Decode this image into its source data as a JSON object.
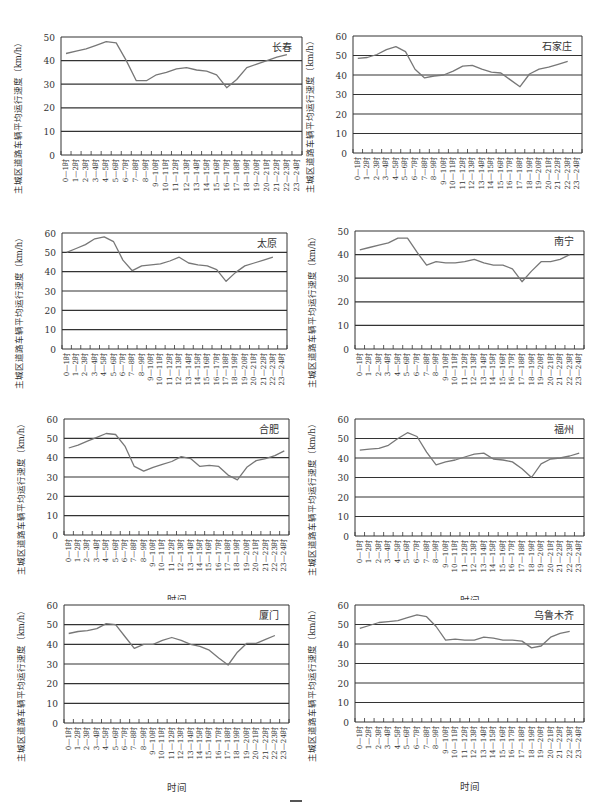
{
  "common": {
    "ylabel": "主城区道路车辆平均运行速度（km/h）",
    "xlabel": "时间",
    "categories": [
      "0—1时",
      "1—2时",
      "2—3时",
      "3—4时",
      "4—5时",
      "5—6时",
      "6—7时",
      "7—8时",
      "8—9时",
      "9—10时",
      "10—11时",
      "11—12时",
      "12—13时",
      "13—14时",
      "14—15时",
      "15—16时",
      "16—17时",
      "17—18时",
      "18—19时",
      "19—20时",
      "20—21时",
      "21—22时",
      "22—23时",
      "23—24时"
    ]
  },
  "chart_data": [
    {
      "type": "line",
      "title": "长春",
      "xlabel": "时间",
      "ylabel": "主城区道路车辆平均运行速度（km/h）",
      "ylim": [
        0,
        50
      ],
      "yticks": [
        0,
        10,
        20,
        30,
        40,
        50
      ],
      "grid": true,
      "categories": [
        "0—1时",
        "1—2时",
        "2—3时",
        "3—4时",
        "4—5时",
        "5—6时",
        "6—7时",
        "7—8时",
        "8—9时",
        "9—10时",
        "10—11时",
        "11—12时",
        "12—13时",
        "13—14时",
        "14—15时",
        "15—16时",
        "16—17时",
        "17—18时",
        "18—19时",
        "19—20时",
        "20—21时",
        "21—22时",
        "22—23时",
        "23—24时"
      ],
      "values": [
        43,
        44,
        45,
        46.5,
        48,
        47.5,
        40,
        31.5,
        31.5,
        34,
        35,
        36.5,
        37,
        36,
        35.5,
        34,
        28.5,
        32,
        37,
        38.5,
        40,
        41.5,
        42.5,
        null
      ]
    },
    {
      "type": "line",
      "title": "石家庄",
      "xlabel": "时间",
      "ylabel": "主城区道路车辆平均运行速度（km/h）",
      "ylim": [
        0,
        60
      ],
      "yticks": [
        0,
        10,
        20,
        30,
        40,
        50,
        60
      ],
      "grid": true,
      "categories": [
        "0—1时",
        "1—2时",
        "2—3时",
        "3—4时",
        "4—5时",
        "5—6时",
        "6—7时",
        "7—8时",
        "8—9时",
        "9—10时",
        "10—11时",
        "11—12时",
        "12—13时",
        "13—14时",
        "14—15时",
        "15—16时",
        "16—17时",
        "17—18时",
        "18—19时",
        "19—20时",
        "20—21时",
        "21—22时",
        "22—23时",
        "23—24时"
      ],
      "values": [
        48.5,
        49,
        50.5,
        53,
        54.5,
        52,
        43,
        38.5,
        39.5,
        40,
        42,
        44.5,
        45,
        43,
        41.5,
        41,
        37.5,
        34,
        40.5,
        43,
        44,
        45.5,
        47,
        null
      ]
    },
    {
      "type": "line",
      "title": "太原",
      "xlabel": "时间",
      "ylabel": "主城区道路车辆平均运行速度（km/h）",
      "ylim": [
        0,
        60
      ],
      "yticks": [
        0,
        10,
        20,
        30,
        40,
        50,
        60
      ],
      "grid": true,
      "categories": [
        "0—1时",
        "1—2时",
        "2—3时",
        "3—4时",
        "4—5时",
        "5—6时",
        "6—7时",
        "7—8时",
        "8—9时",
        "9—10时",
        "10—11时",
        "11—12时",
        "12—13时",
        "13—14时",
        "14—15时",
        "15—16时",
        "16—17时",
        "17—18时",
        "18—19时",
        "19—20时",
        "20—21时",
        "21—22时",
        "22—23时",
        "23—24时"
      ],
      "values": [
        50,
        52,
        54,
        57,
        58,
        55.5,
        46,
        40.5,
        43,
        43.5,
        44,
        45.5,
        47.5,
        44.5,
        43.5,
        43,
        41,
        35,
        39.5,
        43,
        44.5,
        46,
        47.5,
        null
      ]
    },
    {
      "type": "line",
      "title": "南宁",
      "xlabel": "时间",
      "ylabel": "主城区道路车辆平均运行速度（km/h）",
      "ylim": [
        0,
        50
      ],
      "yticks": [
        0,
        10,
        20,
        30,
        40,
        50
      ],
      "grid": true,
      "categories": [
        "0—1时",
        "1—2时",
        "2—3时",
        "3—4时",
        "4—5时",
        "5—6时",
        "6—7时",
        "7—8时",
        "8—9时",
        "9—10时",
        "10—11时",
        "11—12时",
        "12—13时",
        "13—14时",
        "14—15时",
        "15—16时",
        "16—17时",
        "17—18时",
        "18—19时",
        "19—20时",
        "20—21时",
        "21—22时",
        "22—23时",
        "23—24时"
      ],
      "values": [
        42,
        43,
        44,
        45,
        47,
        47,
        41,
        35.5,
        37,
        36.5,
        36.5,
        37,
        38,
        36.5,
        35.5,
        35.5,
        34,
        28.5,
        33,
        37,
        37,
        38,
        40,
        null
      ]
    },
    {
      "type": "line",
      "title": "合肥",
      "xlabel": "时间",
      "ylabel": "主城区道路车辆平均运行速度（km/h）",
      "ylim": [
        0,
        60
      ],
      "yticks": [
        0,
        10,
        20,
        30,
        40,
        50,
        60
      ],
      "grid": true,
      "categories": [
        "0—1时",
        "1—2时",
        "2—3时",
        "3—4时",
        "4—5时",
        "5—6时",
        "6—7时",
        "7—8时",
        "8—9时",
        "9—10时",
        "10—11时",
        "11—12时",
        "12—13时",
        "13—14时",
        "14—15时",
        "15—16时",
        "16—17时",
        "17—18时",
        "18—19时",
        "19—20时",
        "20—21时",
        "21—22时",
        "22—23时",
        "23—24时"
      ],
      "values": [
        45,
        46.5,
        48.5,
        50.5,
        52.5,
        52,
        46,
        35.5,
        33,
        35,
        36.5,
        38,
        40.5,
        39.5,
        35.5,
        36,
        35.5,
        31,
        28.5,
        35,
        38.5,
        39.5,
        41,
        43.5
      ]
    },
    {
      "type": "line",
      "title": "福州",
      "xlabel": "时间",
      "ylabel": "主城区道路车辆平均运行速度（km/h）",
      "ylim": [
        0,
        60
      ],
      "yticks": [
        0,
        10,
        20,
        30,
        40,
        50,
        60
      ],
      "grid": true,
      "categories": [
        "0—1时",
        "1—2时",
        "2—3时",
        "3—4时",
        "4—5时",
        "5—6时",
        "6—7时",
        "7—8时",
        "8—9时",
        "9—10时",
        "10—11时",
        "11—12时",
        "12—13时",
        "13—14时",
        "14—15时",
        "15—16时",
        "16—17时",
        "17—18时",
        "18—19时",
        "19—20时",
        "20—21时",
        "21—22时",
        "22—23时",
        "23—24时"
      ],
      "values": [
        44,
        44.5,
        45,
        46.5,
        50,
        53,
        51,
        43,
        36.5,
        38,
        39,
        40.5,
        42,
        42.5,
        39.5,
        39,
        38,
        34.5,
        30,
        37,
        39.5,
        40,
        41,
        42.5
      ]
    },
    {
      "type": "line",
      "title": "厦门",
      "xlabel": "时间",
      "ylabel": "主城区道路车辆平均运行速度（km/h）",
      "ylim": [
        0,
        60
      ],
      "yticks": [
        0,
        10,
        20,
        30,
        40,
        50,
        60
      ],
      "grid": true,
      "categories": [
        "0—1时",
        "1—2时",
        "2—3时",
        "3—4时",
        "4—5时",
        "5—6时",
        "6—7时",
        "7—8时",
        "8—9时",
        "9—10时",
        "10—11时",
        "11—12时",
        "12—13时",
        "13—14时",
        "14—15时",
        "15—16时",
        "16—17时",
        "17—18时",
        "18—19时",
        "19—20时",
        "20—21时",
        "21—22时",
        "22—23时",
        "23—24时"
      ],
      "values": [
        45.5,
        46.5,
        47,
        48,
        50.5,
        50,
        44,
        38,
        40,
        40,
        42,
        43.5,
        42,
        40,
        39,
        37,
        33,
        29.5,
        36,
        40.5,
        40.5,
        42.5,
        44.5,
        null
      ]
    },
    {
      "type": "line",
      "title": "乌鲁木齐",
      "xlabel": "时间",
      "ylabel": "主城区道路车辆平均运行速度（km/h）",
      "ylim": [
        0,
        60
      ],
      "yticks": [
        0,
        10,
        20,
        30,
        40,
        50,
        60
      ],
      "grid": true,
      "categories": [
        "0—1时",
        "1—2时",
        "2—3时",
        "3—4时",
        "4—5时",
        "5—6时",
        "6—7时",
        "7—8时",
        "8—9时",
        "9—10时",
        "10—11时",
        "11—12时",
        "12—13时",
        "13—14时",
        "14—15时",
        "15—16时",
        "16—17时",
        "17—18时",
        "18—19时",
        "19—20时",
        "20—21时",
        "21—22时",
        "22—23时",
        "23—24时"
      ],
      "values": [
        48,
        49.5,
        51,
        51.5,
        52,
        53.5,
        55,
        54,
        49,
        42,
        42.5,
        42,
        42,
        43.5,
        43,
        42,
        42,
        41.5,
        38,
        39,
        43.5,
        45.5,
        46.5,
        null
      ]
    }
  ]
}
